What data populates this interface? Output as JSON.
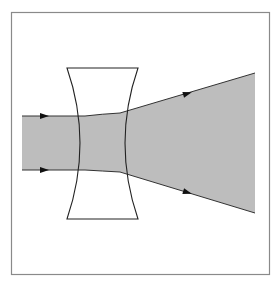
{
  "diagram": {
    "title": "",
    "colors": {
      "background": "#ffffff",
      "frame": "#8a8a8a",
      "beam_fill": "#bdbdbd",
      "lens_stroke": "#222222",
      "ray_stroke": "#333333",
      "arrow_fill": "#111111"
    },
    "frame": {
      "x": 11,
      "y": 12,
      "width": 258,
      "height": 263
    },
    "lens": {
      "type": "biconcave",
      "top_y": 68,
      "bottom_y": 219,
      "top_left_x": 67,
      "top_right_x": 138,
      "left_surface_waist_x": 85,
      "right_surface_waist_x": 120
    },
    "beam": {
      "incoming": {
        "x_start": 22,
        "top_y": 116,
        "bottom_y": 170
      },
      "inside_lens": {
        "entry_top_y": 116,
        "entry_bottom_y": 170,
        "exit_top_y": 113,
        "exit_bottom_y": 172
      },
      "outgoing": {
        "x_end": 255,
        "top_y": 73,
        "bottom_y": 213
      }
    },
    "arrows": [
      {
        "name": "incoming-top-arrow",
        "x": 45,
        "y": 116,
        "angle": 0
      },
      {
        "name": "incoming-bottom-arrow",
        "x": 45,
        "y": 170,
        "angle": 0
      },
      {
        "name": "outgoing-top-arrow",
        "x": 188,
        "y": 94,
        "angle": -15
      },
      {
        "name": "outgoing-bottom-arrow",
        "x": 188,
        "y": 192,
        "angle": 15
      }
    ]
  }
}
